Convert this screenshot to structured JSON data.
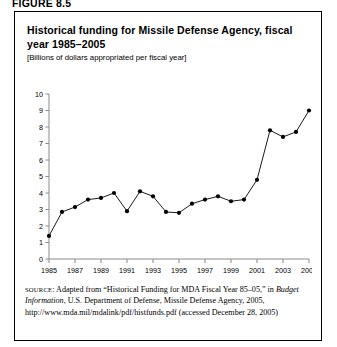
{
  "figure": {
    "label": "FIGURE 8.5"
  },
  "panel": {
    "title": "Historical funding for Missile Defense Agency, fiscal year 1985–2005",
    "subtitle": "[Billions of dollars appropriated per fiscal year]"
  },
  "source_note": {
    "prefix": "SOURCE",
    "part1": ": Adapted from “Historical Funding for MDA Fiscal Year 85–05,” in ",
    "italic1": "Budget Information",
    "part2": ", U.S. Department of Defense, Missile Defense Agency, 2005, http://www.mda.mil/mdalink/pdf/histfunds.pdf (accessed December 28, 2005)"
  },
  "chart_data": {
    "type": "line",
    "title": "Historical funding for Missile Defense Agency, fiscal year 1985–2005",
    "xlabel": "",
    "ylabel": "",
    "subtitle": "[Billions of dollars appropriated per fiscal year]",
    "grid": false,
    "legend": "none",
    "marker": "filled-circle",
    "xlim": [
      1985,
      2005
    ],
    "ylim": [
      0,
      10
    ],
    "yticks": [
      0,
      1,
      2,
      3,
      4,
      5,
      6,
      7,
      8,
      9,
      10
    ],
    "ytick_labels": [
      "0",
      "1",
      "2",
      "3",
      "4",
      "5",
      "6",
      "7",
      "8",
      "9",
      "10"
    ],
    "xticks": [
      1985,
      1987,
      1989,
      1991,
      1993,
      1995,
      1997,
      1999,
      2001,
      2003,
      2005
    ],
    "xtick_labels": [
      "1985",
      "1987",
      "1989",
      "1991",
      "1993",
      "1995",
      "1997",
      "1999",
      "2001",
      "2003",
      "2005"
    ],
    "x": [
      1985,
      1986,
      1987,
      1988,
      1989,
      1990,
      1991,
      1992,
      1993,
      1994,
      1995,
      1996,
      1997,
      1998,
      1999,
      2000,
      2001,
      2002,
      2003,
      2004,
      2005
    ],
    "values": [
      1.4,
      2.85,
      3.15,
      3.6,
      3.7,
      4.0,
      2.9,
      4.1,
      3.8,
      2.85,
      2.8,
      3.35,
      3.6,
      3.8,
      3.5,
      3.6,
      4.8,
      7.8,
      7.4,
      7.7,
      9.0
    ],
    "series": [
      {
        "name": "Missile Defense Agency funding",
        "values": [
          1.4,
          2.85,
          3.15,
          3.6,
          3.7,
          4.0,
          2.9,
          4.1,
          3.8,
          2.85,
          2.8,
          3.35,
          3.6,
          3.8,
          3.5,
          3.6,
          4.8,
          7.8,
          7.4,
          7.7,
          9.0
        ]
      }
    ],
    "line_color": "#000000",
    "marker_color": "#000000"
  }
}
